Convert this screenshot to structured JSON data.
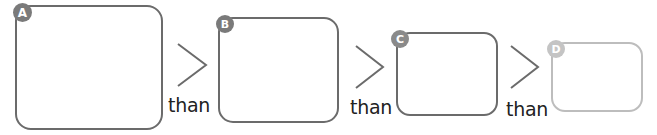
{
  "diagram": {
    "colors": {
      "dark_stroke": "#6b6b6b",
      "light_stroke": "#bdbdbd",
      "badge_dark": "#7a7a7a",
      "badge_light": "#c4c4c4",
      "text": "#222222"
    },
    "boxes": [
      {
        "label": "A"
      },
      {
        "label": "B"
      },
      {
        "label": "C"
      },
      {
        "label": "D"
      }
    ],
    "comparators": [
      {
        "symbol": ">",
        "word": "than"
      },
      {
        "symbol": ">",
        "word": "than"
      },
      {
        "symbol": ">",
        "word": "than"
      }
    ]
  }
}
